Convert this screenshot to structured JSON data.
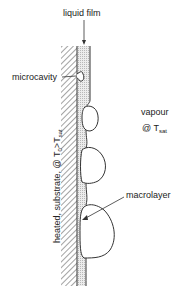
{
  "labels": {
    "liquid_film": "liquid film",
    "microcavity": "microcavity",
    "vapour": "vapour",
    "vapour_at": "@ T",
    "vapour_sub": "sat",
    "macrolayer": "macrolayer",
    "substrate_prefix": "heated, substrate, @ T",
    "substrate_sub0": "0",
    "substrate_gt": ">T",
    "substrate_sub_sat": "sat"
  },
  "colors": {
    "line": "#333333",
    "film_fill": "#d9d9d9",
    "hatch": "#555555",
    "background": "#ffffff"
  }
}
